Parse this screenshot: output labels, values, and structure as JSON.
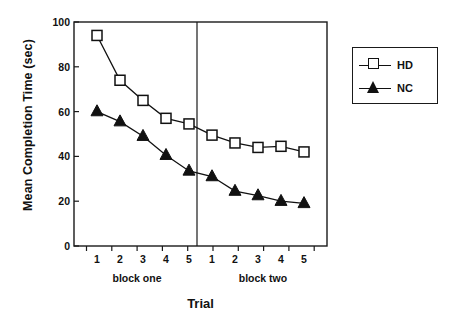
{
  "chart_data": {
    "type": "line",
    "title": "",
    "xlabel": "Trial",
    "ylabel": "Mean Completion Time (sec)",
    "ylim": [
      0,
      100
    ],
    "yticks": [
      0,
      20,
      40,
      60,
      80,
      100
    ],
    "ytick_labels": [
      "0",
      "20",
      "40",
      "60",
      "80",
      "100"
    ],
    "grid": false,
    "x": [
      1,
      2,
      3,
      4,
      5,
      6,
      7,
      8,
      9,
      10
    ],
    "categories": [
      "1",
      "2",
      "3",
      "4",
      "5",
      "1",
      "2",
      "3",
      "4",
      "5"
    ],
    "group_labels": [
      "block one",
      "block two"
    ],
    "group_divider_after_index": 5,
    "legend_position": "right-outside",
    "series": [
      {
        "name": "HD",
        "marker": "open-square",
        "color": "#111111",
        "values": [
          94,
          74,
          65,
          57,
          54.5,
          49.5,
          46,
          44,
          44.5,
          42
        ]
      },
      {
        "name": "NC",
        "marker": "filled-triangle",
        "color": "#111111",
        "values": [
          60,
          55.5,
          49,
          40.5,
          33.5,
          31,
          24.5,
          22.5,
          20,
          19
        ]
      }
    ]
  },
  "axes": {
    "y_axis_label": "Mean Completion Time (sec)",
    "x_axis_label": "Trial"
  },
  "legend": {
    "entries": [
      {
        "label": "HD",
        "marker": "open-square"
      },
      {
        "label": "NC",
        "marker": "filled-triangle"
      }
    ]
  },
  "colors": {
    "line": "#111111",
    "axis": "#1a1a1a",
    "background": "#ffffff"
  }
}
